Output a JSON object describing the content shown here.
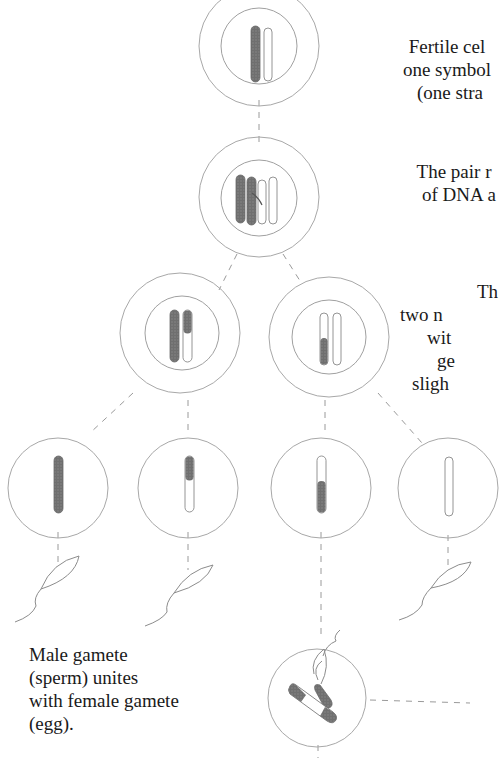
{
  "diagram": {
    "colors": {
      "line": "#9a9a9a",
      "chromosome_dark": "#6b6b6b",
      "chromosome_outline": "#7a7a7a",
      "text": "#1a1a1a",
      "background": "#ffffff"
    },
    "nodes": [
      {
        "id": "fertile-cell",
        "level": 1,
        "chromosomes": [
          "dark",
          "light"
        ]
      },
      {
        "id": "replicated-pair",
        "level": 2,
        "chromosomes": [
          "dark",
          "dark",
          "light",
          "light"
        ],
        "crossover": true
      },
      {
        "id": "division-left",
        "level": 3,
        "chromosomes": [
          "dark",
          "dark-top-light-bottom"
        ]
      },
      {
        "id": "division-right",
        "level": 3,
        "chromosomes": [
          "light-top-dark-bottom",
          "light"
        ]
      },
      {
        "id": "gamete-1",
        "level": 4,
        "chromosome": "dark"
      },
      {
        "id": "gamete-2",
        "level": 4,
        "chromosome": "dark-top-light-bottom"
      },
      {
        "id": "gamete-3",
        "level": 4,
        "chromosome": "light-top-dark-bottom"
      },
      {
        "id": "gamete-4",
        "level": 4,
        "chromosome": "light"
      },
      {
        "id": "sperm-1",
        "level": 5,
        "icon": "sperm-icon"
      },
      {
        "id": "sperm-2",
        "level": 5,
        "icon": "sperm-icon"
      },
      {
        "id": "sperm-4",
        "level": 5,
        "icon": "sperm-icon"
      },
      {
        "id": "fertilized-egg",
        "level": 6,
        "icon": "egg-cell-icon"
      }
    ]
  },
  "labels": {
    "fertile_cell": {
      "lines": [
        "Fertile cel",
        "one symbol",
        "(one stra"
      ]
    },
    "pair_replicate": {
      "lines": [
        "The pair r",
        "of DNA a"
      ]
    },
    "division": {
      "lines": [
        "Th",
        "two n",
        "wit",
        "ge",
        "sligh"
      ]
    },
    "male_gamete": {
      "lines": [
        "Male gamete",
        "(sperm) unites",
        "with female gamete",
        "(egg)."
      ]
    }
  }
}
